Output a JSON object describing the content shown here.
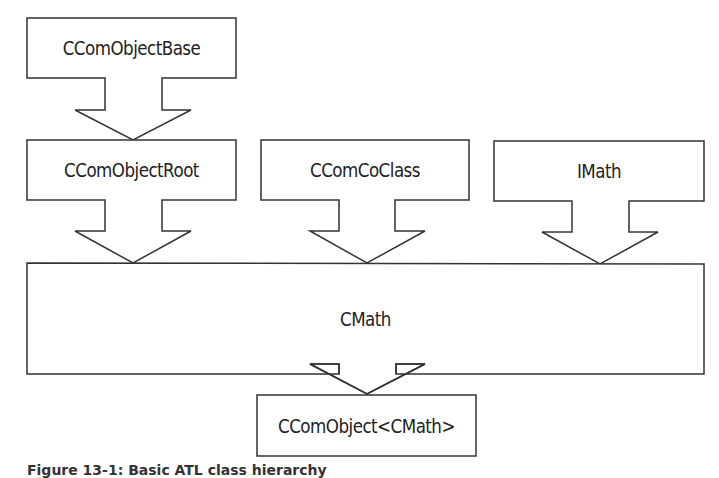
{
  "diagram": {
    "nodes": [
      {
        "id": "base",
        "label": "CComObjectBase"
      },
      {
        "id": "root",
        "label": "CComObjectRoot"
      },
      {
        "id": "coclass",
        "label": "CComCoClass"
      },
      {
        "id": "imath",
        "label": "IMath"
      },
      {
        "id": "cmath",
        "label": "CMath"
      },
      {
        "id": "ccomobject",
        "label": "CComObject<CMath>"
      }
    ],
    "edges": [
      {
        "from": "base",
        "to": "root"
      },
      {
        "from": "root",
        "to": "cmath"
      },
      {
        "from": "coclass",
        "to": "cmath"
      },
      {
        "from": "imath",
        "to": "cmath"
      },
      {
        "from": "cmath",
        "to": "ccomobject"
      }
    ],
    "caption": "Figure 13-1: Basic ATL class hierarchy"
  }
}
